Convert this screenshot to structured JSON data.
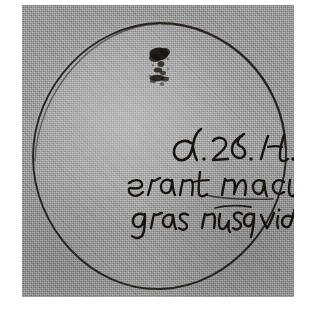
{
  "image": {
    "kind": "historical-manuscript-photograph",
    "subject": "sunspot observation drawing",
    "caption": "Hand-drawn solar disk with sunspot and Latin annotation",
    "width": 322,
    "height": 322
  },
  "plate": {
    "paper_color": "#9b9b9b",
    "margin_color": "#ffffff",
    "ink_color": "#17130f",
    "texture": "halftone-grain"
  },
  "drawing": {
    "solar_disk": {
      "name": "solar disk",
      "shape": "circle",
      "stroke_color": "#2a241e",
      "center_x": 160,
      "center_y": 156,
      "radius_x": 128,
      "radius_y": 134
    },
    "sunspot": {
      "name": "sunspot ink blot",
      "color": "#191410",
      "center_x": 141,
      "center_y": 66,
      "description": "dark irregular cluster near upper part of disk"
    }
  },
  "inscription": {
    "name": "handwritten Latin annotation",
    "script": "17th-century italic cursive",
    "ink_color": "#17130f",
    "lines": [
      {
        "id": "line-1",
        "text": "d. 28. H.",
        "note": "date marker"
      },
      {
        "id": "line-2",
        "text": "erant macu",
        "note": "cut off at right edge"
      },
      {
        "id": "line-3",
        "text": "gras nusq vide",
        "note": "cut off, ends in ink blot"
      }
    ],
    "blot": {
      "name": "ink blot",
      "color": "#15110d",
      "x": 176,
      "y": 78
    }
  }
}
